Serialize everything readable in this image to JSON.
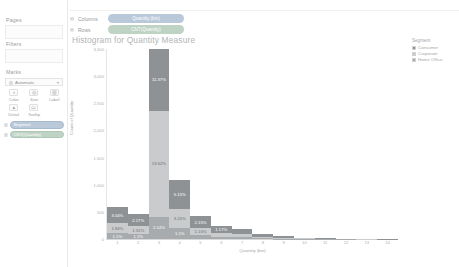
{
  "app": {
    "name": "Tableau Worksheet"
  },
  "left_panel": {
    "pages": {
      "title": "Pages"
    },
    "filters": {
      "title": "Filters"
    },
    "marks": {
      "title": "Marks",
      "type_label": "Automatic",
      "type_icon": "bar-icon",
      "dropdown_icon": "▾",
      "buttons": [
        {
          "name": "color",
          "label": "Color",
          "icon": "◑"
        },
        {
          "name": "size",
          "label": "Size",
          "icon": "◎"
        },
        {
          "name": "label",
          "label": "Label",
          "icon": "▥"
        },
        {
          "name": "detail",
          "label": "Detail",
          "icon": "▲"
        },
        {
          "name": "tooltip",
          "label": "Tooltip",
          "icon": "▭"
        }
      ],
      "pills": [
        {
          "label": "Segment",
          "color": "blue",
          "icon": "▥"
        },
        {
          "label": "CNT(Quantity)",
          "color": "green",
          "icon": "▥"
        }
      ]
    }
  },
  "shelves": [
    {
      "name": "columns",
      "label": "Columns",
      "icon": "▤",
      "pill": "Quantity (bin)",
      "pill_color": "#b9c9da"
    },
    {
      "name": "rows",
      "label": "Rows",
      "icon": "▤",
      "pill": "CNT(Quantity)",
      "pill_color": "#bed3c3"
    }
  ],
  "chart_data": {
    "type": "bar",
    "title": "Histogram for Quantity Measure",
    "xlabel": "Quantity (bin)",
    "ylabel": "Count of Quantity",
    "stacked": true,
    "grid": false,
    "legend_position": "right",
    "ylim": [
      0,
      3500
    ],
    "yticks": [
      0,
      500,
      1000,
      1500,
      2000,
      2500,
      3000,
      3500
    ],
    "ytick_labels": [
      "0",
      "500",
      "1,000",
      "1,500",
      "2,000",
      "2,500",
      "3,000",
      "3,500"
    ],
    "categories": [
      "1",
      "2",
      "3",
      "4",
      "5",
      "6",
      "7",
      "8",
      "9",
      "10",
      "11",
      "12",
      "13",
      "14"
    ],
    "legend_title": "Segment",
    "series": [
      {
        "name": "Consumer",
        "color": "#8f9295",
        "values": [
          300,
          225,
          1180,
          530,
          220,
          120,
          95,
          48,
          24,
          12,
          7,
          4,
          3,
          2
        ],
        "labels": [
          "3.04%",
          "2.17%",
          "11.37%",
          "5.13%",
          "2.15%",
          "1.17%",
          "",
          "",
          "",
          "",
          "",
          "",
          "",
          ""
        ]
      },
      {
        "name": "Corporate",
        "color": "#c9cbcd",
        "values": [
          185,
          140,
          2035,
          340,
          125,
          70,
          55,
          28,
          14,
          7,
          4,
          3,
          2,
          1
        ],
        "labels": [
          "1.84%",
          "1.31%",
          "19.62%",
          "3.24%",
          "1.16%",
          "",
          "",
          "",
          "",
          "",
          "",
          "",
          "",
          ""
        ]
      },
      {
        "name": "Home Office",
        "color": "#a8abae",
        "values": [
          105,
          92,
          430,
          212,
          78,
          45,
          30,
          16,
          9,
          5,
          3,
          2,
          1,
          1
        ],
        "labels": [
          "1.1%",
          "1.1%",
          "2.14%",
          "1.1%",
          "",
          "",
          "",
          "",
          "",
          "",
          "",
          "",
          "",
          ""
        ]
      }
    ],
    "legend_items": [
      {
        "label": "Consumer",
        "color": "#8f9295"
      },
      {
        "label": "Corporate",
        "color": "#c9cbcd"
      },
      {
        "label": "Home Office",
        "color": "#a8abae"
      }
    ]
  }
}
